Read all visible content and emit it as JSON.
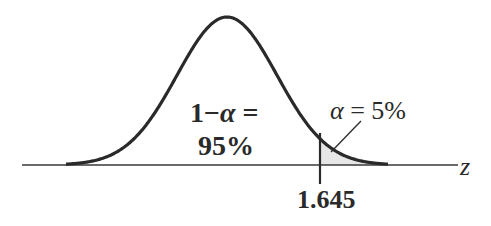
{
  "figure": {
    "type": "normal-distribution-one-tailed",
    "axis_label": "z",
    "critical_value_label": "1.645",
    "confidence_label_line1": "1 − α =",
    "confidence_label_line1_parts": {
      "one": "1",
      "minus": "−",
      "alpha": "α",
      "eq": " ="
    },
    "confidence_label_line2": "95%",
    "alpha_label": "α = 5%",
    "alpha_label_parts": {
      "alpha": "α",
      "rest": " = 5%"
    },
    "colors": {
      "curve": "#2a2a2a",
      "axis": "#3a3a3a",
      "shade": "#e6e6e6",
      "text": "#2a2a2a"
    }
  },
  "chart_data": {
    "type": "area",
    "title": "",
    "xlabel": "z",
    "ylabel": "",
    "distribution": "standard normal",
    "critical_value": 1.645,
    "regions": [
      {
        "name": "non-rejection",
        "label": "1 − α = 95%",
        "probability": 0.95,
        "range": [
          "-inf",
          1.645
        ]
      },
      {
        "name": "rejection (right tail, shaded)",
        "label": "α = 5%",
        "probability": 0.05,
        "range": [
          1.645,
          "inf"
        ]
      }
    ],
    "annotations": [
      "1 − α = 95%",
      "α = 5%",
      "1.645",
      "z"
    ],
    "grid": false,
    "legend": "none"
  }
}
